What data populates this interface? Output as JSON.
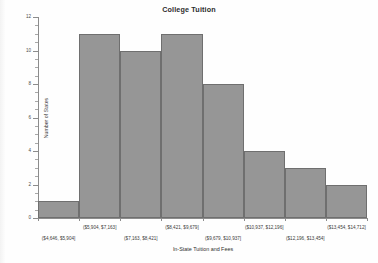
{
  "chart_data": {
    "type": "bar",
    "title": "College Tuition",
    "xlabel": "In-State Tuition and Fees",
    "ylabel": "Number of States",
    "categories": [
      "($4,646, $5,904]",
      "($5,904, $7,163]",
      "($7,163, $8,421]",
      "($8,421, $9,679]",
      "($9,679, $10,937]",
      "($10,937, $12,196]",
      "($12,196, $13,454]",
      "($13,454, $14,712]"
    ],
    "values": [
      1,
      11,
      10,
      11,
      8,
      4,
      3,
      2
    ],
    "ylim": [
      0,
      12
    ],
    "ytick_labels": [
      "0",
      "2",
      "4",
      "6",
      "8",
      "10",
      "12"
    ],
    "ytick_values": [
      0,
      2,
      4,
      6,
      8,
      10,
      12
    ],
    "yminor_step": 0.5,
    "grid": false,
    "legend": "none",
    "bar_color": "#969696",
    "bar_edge_color": "#6f6f6f",
    "axis_color": "#8c8c8c"
  },
  "axis": {
    "y_title": "Number of States",
    "x_title": "In-State Tuition and Fees"
  }
}
